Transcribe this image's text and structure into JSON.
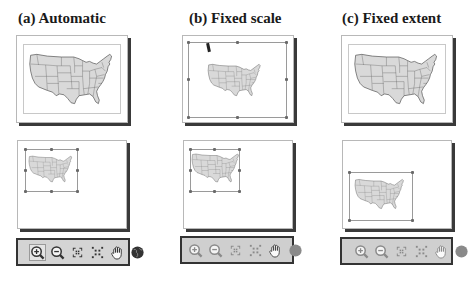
{
  "panels": [
    {
      "id": "a",
      "title": "(a)  Automatic",
      "toolbar_state": "enabled",
      "tools": [
        {
          "icon": "zoom-in-icon",
          "label": "Zoom In",
          "active": true
        },
        {
          "icon": "zoom-out-icon",
          "label": "Zoom Out",
          "active": false
        },
        {
          "icon": "fixed-zoom-in-icon",
          "label": "Fixed Zoom In",
          "active": false
        },
        {
          "icon": "fixed-zoom-out-icon",
          "label": "Fixed Zoom Out",
          "active": false
        },
        {
          "icon": "pan-hand-icon",
          "label": "Pan",
          "active": false
        },
        {
          "icon": "full-extent-globe-icon",
          "label": "Full Extent",
          "active": false
        }
      ]
    },
    {
      "id": "b",
      "title": "(b) Fixed scale",
      "toolbar_state": "disabled",
      "tools": [
        {
          "icon": "zoom-in-icon",
          "label": "Zoom In",
          "active": false
        },
        {
          "icon": "zoom-out-icon",
          "label": "Zoom Out",
          "active": false
        },
        {
          "icon": "fixed-zoom-in-icon",
          "label": "Fixed Zoom In",
          "active": false
        },
        {
          "icon": "fixed-zoom-out-icon",
          "label": "Fixed Zoom Out",
          "active": false
        },
        {
          "icon": "pan-hand-icon",
          "label": "Pan",
          "active": false
        },
        {
          "icon": "full-extent-globe-icon",
          "label": "Full Extent",
          "active": false
        }
      ]
    },
    {
      "id": "c",
      "title": "(c) Fixed extent",
      "toolbar_state": "disabled",
      "tools": [
        {
          "icon": "zoom-in-icon",
          "label": "Zoom In",
          "active": false
        },
        {
          "icon": "zoom-out-icon",
          "label": "Zoom Out",
          "active": false
        },
        {
          "icon": "fixed-zoom-in-icon",
          "label": "Fixed Zoom In",
          "active": false
        },
        {
          "icon": "fixed-zoom-out-icon",
          "label": "Fixed Zoom Out",
          "active": false
        },
        {
          "icon": "pan-hand-icon",
          "label": "Pan",
          "active": false
        },
        {
          "icon": "full-extent-globe-icon",
          "label": "Full Extent",
          "active": false
        }
      ]
    }
  ],
  "colors": {
    "map_fill": "#d9d9d9",
    "map_stroke": "#555555",
    "toolbar_bg": "#d4d4d4",
    "icon_enabled": "#333333",
    "icon_disabled": "#8a8a8a"
  }
}
